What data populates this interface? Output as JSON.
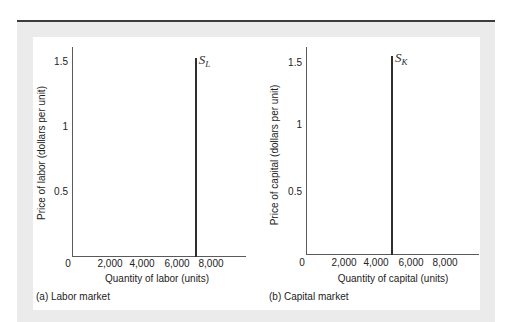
{
  "figure": {
    "panels": [
      {
        "caption": "(a) Labor market",
        "y_axis_title": "Price of labor (dollars per unit)",
        "x_axis_title": "Quantity of labor (units)",
        "y_tick_labels": [
          "1.5",
          "1",
          "0.5"
        ],
        "origin_label": "0",
        "x_tick_labels": [
          "2,000",
          "4,000",
          "6,000",
          "8,000"
        ],
        "curve_label": {
          "symbol": "S",
          "subscript": "L"
        }
      },
      {
        "caption": "(b) Capital market",
        "y_axis_title": "Price of capital (dollars per unit)",
        "x_axis_title": "Quantity of capital (units)",
        "y_tick_labels": [
          "1.5",
          "1",
          "0.5"
        ],
        "origin_label": "0",
        "x_tick_labels": [
          "2,000",
          "4,000",
          "6,000",
          "8,000"
        ],
        "curve_label": {
          "symbol": "S",
          "subscript": "K"
        }
      }
    ]
  },
  "colors": {
    "frame_rule": "#3c3c3c",
    "frame_background": "#ebebeb",
    "plot_background": "#ffffff",
    "axis": "#5a5a5a",
    "supply_curve": "#2e2e2e"
  },
  "chart_data": [
    {
      "type": "line",
      "title": "(a) Labor market",
      "xlabel": "Quantity of labor (units)",
      "ylabel": "Price of labor (dollars per unit)",
      "xlim": [
        0,
        10000
      ],
      "ylim": [
        0,
        1.6
      ],
      "xticks": [
        0,
        2000,
        4000,
        6000,
        8000
      ],
      "yticks": [
        0.5,
        1,
        1.5
      ],
      "grid": false,
      "legend": "none (curve labeled inline)",
      "series": [
        {
          "name": "S_L",
          "description": "Vertical labor supply curve",
          "x": [
            7000,
            7000
          ],
          "y": [
            0,
            1.52
          ]
        }
      ]
    },
    {
      "type": "line",
      "title": "(b) Capital market",
      "xlabel": "Quantity of capital (units)",
      "ylabel": "Price of capital (dollars per unit)",
      "xlim": [
        0,
        10000
      ],
      "ylim": [
        0,
        1.6
      ],
      "xticks": [
        0,
        2000,
        4000,
        6000,
        8000
      ],
      "yticks": [
        0.5,
        1,
        1.5
      ],
      "grid": false,
      "legend": "none (curve labeled inline)",
      "series": [
        {
          "name": "S_K",
          "description": "Vertical capital supply curve",
          "x": [
            5000,
            5000
          ],
          "y": [
            0,
            1.52
          ]
        }
      ]
    }
  ]
}
